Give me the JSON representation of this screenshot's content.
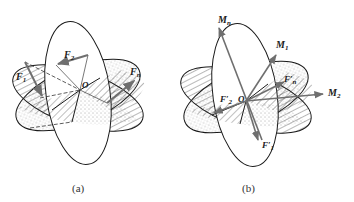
{
  "figure": {
    "panel_a": {
      "caption": "(a)",
      "origin_label": "O",
      "forces": [
        {
          "name": "F",
          "sub": "1"
        },
        {
          "name": "F",
          "sub": "2"
        },
        {
          "name": "F",
          "sub": "n"
        }
      ]
    },
    "panel_b": {
      "caption": "(b)",
      "origin_label": "O",
      "moments": [
        {
          "name": "M",
          "sub": "n"
        },
        {
          "name": "M",
          "sub": "1"
        },
        {
          "name": "M",
          "sub": "2"
        }
      ],
      "forces": [
        {
          "name": "F′",
          "sub": "n"
        },
        {
          "name": "F′",
          "sub": "2"
        },
        {
          "name": "F′",
          "sub": "1"
        }
      ]
    }
  },
  "colors": {
    "line": "#1a1a1a",
    "arrow": "#777777",
    "background": "#ffffff"
  }
}
